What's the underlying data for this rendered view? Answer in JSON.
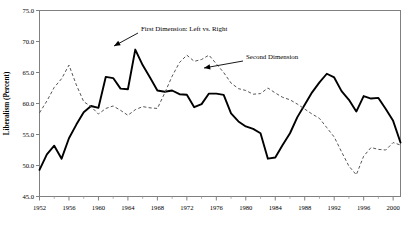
{
  "chart_data": {
    "type": "line",
    "title": "",
    "xlabel": "",
    "ylabel": "Liberalism (Percent)",
    "xlim": [
      1952,
      2001
    ],
    "ylim": [
      45.0,
      75.0
    ],
    "grid": false,
    "legend_position": "inline-annotations",
    "y_ticks": [
      "45.0",
      "50.0",
      "55.0",
      "60.0",
      "65.0",
      "70.0",
      "75.0"
    ],
    "y_tick_values": [
      45.0,
      50.0,
      55.0,
      60.0,
      65.0,
      70.0,
      75.0
    ],
    "x_ticks": [
      "1952",
      "1956",
      "1960",
      "1964",
      "1968",
      "1972",
      "1976",
      "1980",
      "1984",
      "1988",
      "1992",
      "1996",
      "2000"
    ],
    "x_tick_values": [
      1952,
      1956,
      1960,
      1964,
      1968,
      1972,
      1976,
      1980,
      1984,
      1988,
      1992,
      1996,
      2000
    ],
    "x_minor_step": 2,
    "annotations": [
      {
        "name": "first-dimension-annotation",
        "text": "First Dimension: Left vs. Right",
        "text_x": 141,
        "text_y": 31,
        "leader_from_x": 138,
        "leader_from_y": 33,
        "leader_to_x": 114,
        "leader_to_y": 46
      },
      {
        "name": "second-dimension-annotation",
        "text": "Second Dimension",
        "text_x": 246,
        "text_y": 59,
        "leader_from_x": 243,
        "leader_from_y": 61,
        "leader_to_x": 204,
        "leader_to_y": 68
      }
    ],
    "series": [
      {
        "name": "First Dimension: Left vs. Right",
        "style": "solid",
        "color": "#000000",
        "x": [
          1952,
          1953,
          1954,
          1955,
          1956,
          1957,
          1958,
          1959,
          1960,
          1961,
          1962,
          1963,
          1964,
          1965,
          1966,
          1967,
          1968,
          1969,
          1970,
          1971,
          1972,
          1973,
          1974,
          1975,
          1976,
          1977,
          1978,
          1979,
          1980,
          1981,
          1982,
          1983,
          1984,
          1985,
          1986,
          1987,
          1988,
          1989,
          1990,
          1991,
          1992,
          1993,
          1994,
          1995,
          1996,
          1997,
          1998,
          1999,
          2000,
          2001
        ],
        "values": [
          49.3,
          51.8,
          53.2,
          51.1,
          54.4,
          56.6,
          58.6,
          59.6,
          59.3,
          64.3,
          64.1,
          62.4,
          62.3,
          68.7,
          66.2,
          64.2,
          62.1,
          61.9,
          62.1,
          61.5,
          61.4,
          59.4,
          59.9,
          61.6,
          61.6,
          61.4,
          58.4,
          57.1,
          56.3,
          55.9,
          55.2,
          51.1,
          51.3,
          53.3,
          55.2,
          57.8,
          59.8,
          61.8,
          63.4,
          64.8,
          64.2,
          62.0,
          60.6,
          58.7,
          61.2,
          60.8,
          60.9,
          59.1,
          57.2,
          53.7
        ]
      },
      {
        "name": "Second Dimension",
        "style": "dashed",
        "color": "#4d4d4d",
        "x": [
          1952,
          1953,
          1954,
          1955,
          1956,
          1957,
          1958,
          1959,
          1960,
          1961,
          1962,
          1963,
          1964,
          1965,
          1966,
          1967,
          1968,
          1969,
          1970,
          1971,
          1972,
          1973,
          1974,
          1975,
          1976,
          1977,
          1978,
          1979,
          1980,
          1981,
          1982,
          1983,
          1984,
          1985,
          1986,
          1987,
          1988,
          1989,
          1990,
          1991,
          1992,
          1993,
          1994,
          1995,
          1996,
          1997,
          1998,
          1999,
          2000,
          2001
        ],
        "values": [
          58.5,
          60.4,
          62.6,
          64.0,
          66.2,
          63.0,
          60.3,
          59.5,
          58.3,
          59.2,
          59.6,
          58.9,
          58.1,
          59.0,
          59.5,
          59.3,
          59.2,
          61.7,
          64.4,
          66.6,
          67.8,
          66.8,
          67.1,
          67.8,
          66.4,
          65.0,
          63.3,
          62.4,
          62.1,
          61.5,
          61.6,
          62.5,
          61.7,
          61.0,
          60.6,
          59.9,
          59.1,
          58.3,
          57.6,
          56.1,
          54.6,
          52.2,
          49.9,
          48.5,
          51.5,
          52.9,
          52.6,
          52.5,
          53.7,
          53.3
        ]
      }
    ]
  }
}
